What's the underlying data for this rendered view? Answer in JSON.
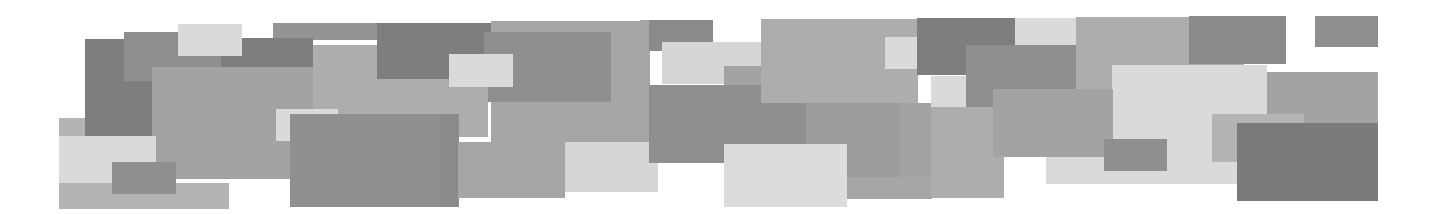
{
  "banner": {
    "description": "Decorative mosaic of overlapping gray rectangles",
    "palette": {
      "darkest": "#7e7e7e",
      "dark": "#8f8f8f",
      "medium_dark": "#9a9a9a",
      "medium": "#a6a6a6",
      "medium_light": "#b4b4b4",
      "light": "#d6d6d6",
      "lightest": "#e0e0e0"
    },
    "rects": [
      {
        "x": 59,
        "y": 118,
        "w": 60,
        "h": 20,
        "c": "#b4b4b4"
      },
      {
        "x": 85,
        "y": 39,
        "w": 70,
        "h": 97,
        "c": "#7e7e7e"
      },
      {
        "x": 124,
        "y": 32,
        "w": 97,
        "h": 49,
        "c": "#8f8f8f"
      },
      {
        "x": 273,
        "y": 23,
        "w": 104,
        "h": 17,
        "c": "#949494"
      },
      {
        "x": 221,
        "y": 38,
        "w": 92,
        "h": 29,
        "c": "#7e7e7e"
      },
      {
        "x": 152,
        "y": 67,
        "w": 161,
        "h": 112,
        "c": "#a3a3a3"
      },
      {
        "x": 313,
        "y": 45,
        "w": 171,
        "h": 92,
        "c": "#adadad"
      },
      {
        "x": 377,
        "y": 23,
        "w": 114,
        "h": 56,
        "c": "#7e7e7e"
      },
      {
        "x": 491,
        "y": 21,
        "w": 159,
        "h": 121,
        "c": "#a6a6a6"
      },
      {
        "x": 484,
        "y": 32,
        "w": 127,
        "h": 70,
        "c": "#8f8f8f"
      },
      {
        "x": 458,
        "y": 85,
        "w": 30,
        "h": 52,
        "c": "#adadad"
      },
      {
        "x": 178,
        "y": 24,
        "w": 64,
        "h": 32,
        "c": "#dadada"
      },
      {
        "x": 449,
        "y": 54,
        "w": 64,
        "h": 33,
        "c": "#dadada"
      },
      {
        "x": 59,
        "y": 136,
        "w": 97,
        "h": 47,
        "c": "#dadada"
      },
      {
        "x": 59,
        "y": 183,
        "w": 170,
        "h": 26,
        "c": "#b4b4b4"
      },
      {
        "x": 112,
        "y": 162,
        "w": 64,
        "h": 32,
        "c": "#8f8f8f"
      },
      {
        "x": 276,
        "y": 109,
        "w": 62,
        "h": 32,
        "c": "#dadada"
      },
      {
        "x": 290,
        "y": 114,
        "w": 169,
        "h": 93,
        "c": "#8f8f8f"
      },
      {
        "x": 440,
        "y": 114,
        "w": 18,
        "h": 93,
        "c": "#8a8a8a"
      },
      {
        "x": 458,
        "y": 142,
        "w": 107,
        "h": 56,
        "c": "#a6a6a6"
      },
      {
        "x": 565,
        "y": 142,
        "w": 93,
        "h": 50,
        "c": "#d6d6d6"
      },
      {
        "x": 640,
        "y": 20,
        "w": 9,
        "h": 70,
        "c": "#a6a6a6"
      },
      {
        "x": 649,
        "y": 20,
        "w": 64,
        "h": 31,
        "c": "#8a8a8a"
      },
      {
        "x": 662,
        "y": 42,
        "w": 99,
        "h": 42,
        "c": "#d6d6d6"
      },
      {
        "x": 724,
        "y": 66,
        "w": 37,
        "h": 30,
        "c": "#a3a3a3"
      },
      {
        "x": 649,
        "y": 85,
        "w": 157,
        "h": 78,
        "c": "#8f8f8f"
      },
      {
        "x": 761,
        "y": 19,
        "w": 157,
        "h": 84,
        "c": "#adadad"
      },
      {
        "x": 806,
        "y": 103,
        "w": 126,
        "h": 74,
        "c": "#9c9c9c"
      },
      {
        "x": 724,
        "y": 144,
        "w": 123,
        "h": 63,
        "c": "#dcdcdc"
      },
      {
        "x": 847,
        "y": 177,
        "w": 85,
        "h": 22,
        "c": "#a6a6a6"
      },
      {
        "x": 885,
        "y": 37,
        "w": 62,
        "h": 32,
        "c": "#dadada"
      },
      {
        "x": 917,
        "y": 18,
        "w": 98,
        "h": 57,
        "c": "#7e7e7e"
      },
      {
        "x": 1015,
        "y": 18,
        "w": 61,
        "h": 27,
        "c": "#dadada"
      },
      {
        "x": 966,
        "y": 45,
        "w": 110,
        "h": 70,
        "c": "#8f8f8f"
      },
      {
        "x": 931,
        "y": 76,
        "w": 35,
        "h": 31,
        "c": "#dadada"
      },
      {
        "x": 900,
        "y": 103,
        "w": 31,
        "h": 74,
        "c": "#a3a3a3"
      },
      {
        "x": 931,
        "y": 107,
        "w": 73,
        "h": 91,
        "c": "#adadad"
      },
      {
        "x": 1076,
        "y": 17,
        "w": 168,
        "h": 90,
        "c": "#adadad"
      },
      {
        "x": 1189,
        "y": 16,
        "w": 97,
        "h": 48,
        "c": "#8a8a8a"
      },
      {
        "x": 1315,
        "y": 16,
        "w": 63,
        "h": 31,
        "c": "#8f8f8f"
      },
      {
        "x": 1112,
        "y": 65,
        "w": 155,
        "h": 119,
        "c": "#dadada"
      },
      {
        "x": 1046,
        "y": 157,
        "w": 181,
        "h": 27,
        "c": "#dadada"
      },
      {
        "x": 993,
        "y": 89,
        "w": 120,
        "h": 68,
        "c": "#a3a3a3"
      },
      {
        "x": 1104,
        "y": 139,
        "w": 63,
        "h": 32,
        "c": "#8f8f8f"
      },
      {
        "x": 1267,
        "y": 72,
        "w": 111,
        "h": 51,
        "c": "#a3a3a3"
      },
      {
        "x": 1212,
        "y": 114,
        "w": 92,
        "h": 48,
        "c": "#b4b4b4"
      },
      {
        "x": 1237,
        "y": 123,
        "w": 141,
        "h": 78,
        "c": "#7a7a7a"
      }
    ]
  }
}
